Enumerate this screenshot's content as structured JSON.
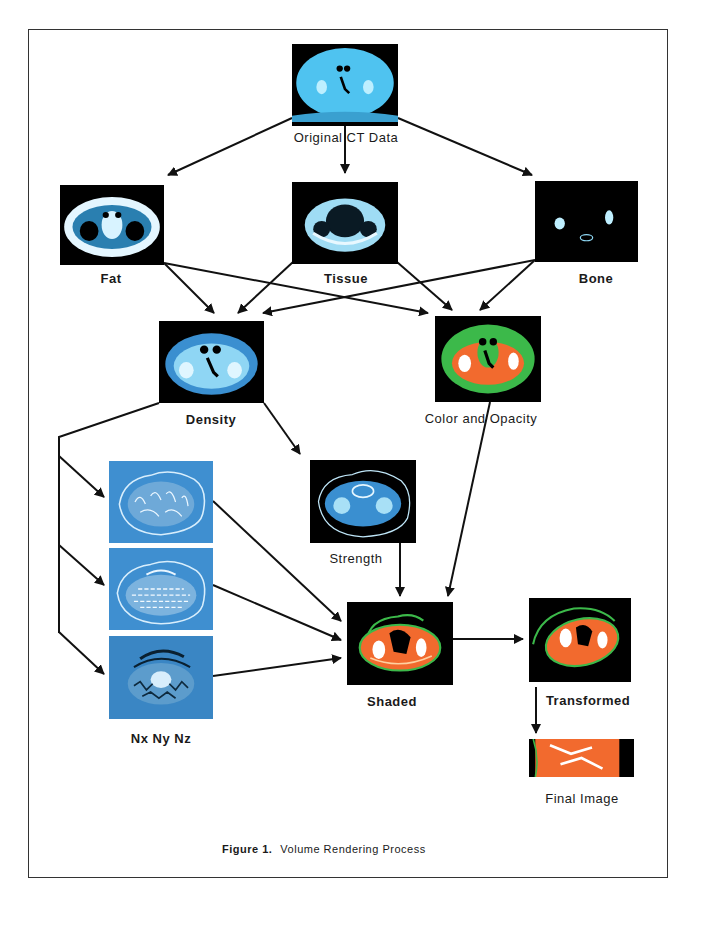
{
  "figure": {
    "caption_label": "Figure 1.",
    "caption_text": "Volume Rendering Process",
    "nodes": [
      {
        "id": "original",
        "label": "Original CT Data",
        "palette": "cyan"
      },
      {
        "id": "fat",
        "label": "Fat",
        "palette": "cyan"
      },
      {
        "id": "tissue",
        "label": "Tissue",
        "palette": "cyan"
      },
      {
        "id": "bone",
        "label": "Bone",
        "palette": "cyan"
      },
      {
        "id": "density",
        "label": "Density",
        "palette": "blue"
      },
      {
        "id": "color",
        "label": "Color and Opacity",
        "palette": "green-orange"
      },
      {
        "id": "nx",
        "label": "Nx",
        "palette": "relief-blue"
      },
      {
        "id": "ny",
        "label": "Ny",
        "palette": "relief-blue"
      },
      {
        "id": "nz",
        "label": "Nz",
        "palette": "relief-blue"
      },
      {
        "id": "strength",
        "label": "Strength",
        "palette": "blue"
      },
      {
        "id": "shaded",
        "label": "Shaded",
        "palette": "orange-green"
      },
      {
        "id": "transformed",
        "label": "Transformed",
        "palette": "orange-green"
      },
      {
        "id": "final",
        "label": "Final Image",
        "palette": "orange"
      }
    ],
    "normals_label": "Nx Ny Nz",
    "edges": [
      [
        "original",
        "fat"
      ],
      [
        "original",
        "tissue"
      ],
      [
        "original",
        "bone"
      ],
      [
        "fat",
        "density"
      ],
      [
        "fat",
        "color"
      ],
      [
        "tissue",
        "density"
      ],
      [
        "tissue",
        "color"
      ],
      [
        "bone",
        "density"
      ],
      [
        "bone",
        "color"
      ],
      [
        "density",
        "strength"
      ],
      [
        "density",
        "nx"
      ],
      [
        "density",
        "ny"
      ],
      [
        "density",
        "nz"
      ],
      [
        "nx",
        "shaded"
      ],
      [
        "ny",
        "shaded"
      ],
      [
        "nz",
        "shaded"
      ],
      [
        "strength",
        "shaded"
      ],
      [
        "color",
        "shaded"
      ],
      [
        "shaded",
        "transformed"
      ],
      [
        "transformed",
        "final"
      ]
    ],
    "colors": {
      "cyan": "#4fc3f0",
      "blue": "#3a8fd0",
      "green": "#3cb94a",
      "orange": "#f26a2e",
      "relief": "#3f8fd0"
    }
  }
}
